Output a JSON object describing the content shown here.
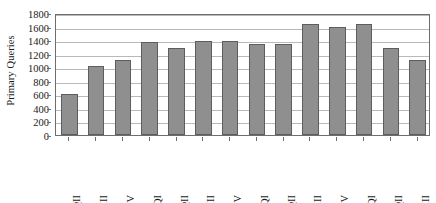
{
  "chart_data": {
    "type": "bar",
    "title": "",
    "subtitle": "",
    "xlabel": "",
    "ylabel": "Primary Queries",
    "ylim": [
      0,
      1800
    ],
    "ytick_step": 200,
    "yticks": [
      0,
      200,
      400,
      600,
      800,
      1000,
      1200,
      1400,
      1600,
      1800
    ],
    "ytick_labels": [
      "0",
      "200",
      "400",
      "600",
      "800",
      "1000",
      "1200",
      "1400",
      "1600",
      "1800"
    ],
    "grid": true,
    "grid_axis": "y",
    "legend": false,
    "legend_position": "none",
    "bar_color": "#8f8f8f",
    "bar_edge_color": "#5d5d5d",
    "plot_border_color": "#6e6e6e",
    "gridline_color": "#b9b9b9",
    "background_color": "#ffffff",
    "categories": [
      "2004QII",
      "2004QIII",
      "2004QIV",
      "2005QI",
      "2005QII",
      "2005QIII",
      "2005QIV",
      "2006QI",
      "2006QII",
      "2006QIII",
      "2006QIV",
      "2007QI",
      "2007QII",
      "2007QIII"
    ],
    "values": [
      600,
      1020,
      1110,
      1370,
      1280,
      1390,
      1390,
      1350,
      1350,
      1640,
      1600,
      1640,
      1280,
      1100
    ]
  }
}
